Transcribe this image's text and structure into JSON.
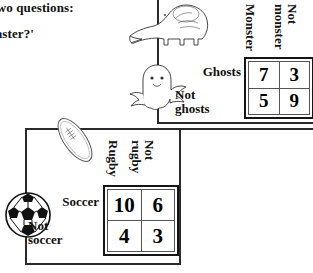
{
  "prose": {
    "line1": "se two questions:",
    "line2": "Monster?'"
  },
  "monster_table": {
    "column_headers": [
      "Monster",
      "Not monster"
    ],
    "column_header_1_line1": "Monster",
    "column_header_2_line1": "Not",
    "column_header_2_line2": "monster",
    "row_headers": [
      "Ghosts",
      "Not ghosts"
    ],
    "row_header_1": "Ghosts",
    "row_header_2": "Not\nghosts",
    "cells": [
      [
        7,
        3
      ],
      [
        5,
        9
      ]
    ],
    "cell_r1c1": "7",
    "cell_r1c2": "3",
    "cell_r2c1": "5",
    "cell_r2c2": "9"
  },
  "sport_table": {
    "column_headers": [
      "Rugby",
      "Not rugby"
    ],
    "column_header_1_line1": "Rugby",
    "column_header_2_line1": "Not",
    "column_header_2_line2": "rugby",
    "row_headers": [
      "Soccer",
      "Not soccer"
    ],
    "row_header_1": "Soccer",
    "row_header_2": "Not\nsoccer",
    "cells": [
      [
        10,
        6
      ],
      [
        4,
        3
      ]
    ],
    "cell_r1c1": "10",
    "cell_r1c2": "6",
    "cell_r2c1": "4",
    "cell_r2c2": "3"
  },
  "artwork": {
    "dinosaur": "dinosaur-illustration",
    "ghost": "ghost-illustration",
    "rugby_ball": "rugby-ball-illustration",
    "soccer_ball": "soccer-ball-illustration"
  },
  "colors": {
    "ink": "#000000",
    "rule": "#2a2a2a",
    "grid": "#555555",
    "page": "#ffffff"
  }
}
